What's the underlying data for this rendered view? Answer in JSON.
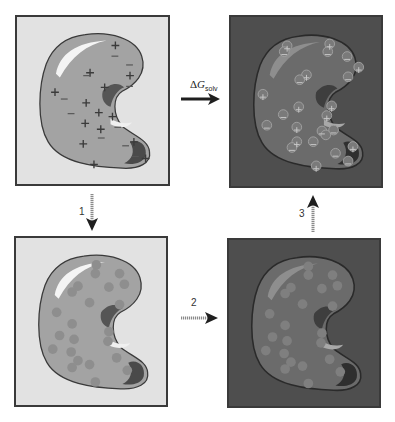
{
  "figure": {
    "colors": {
      "vacuum_bg": "#e2e2e2",
      "solvent_bg": "#4e4e4e",
      "protein_fill_vacuum": "#a3a3a3",
      "protein_fill_solvent": "#6b6b6b",
      "panel_border": "#3a3a3a",
      "arrow_solid": "#1f1f1f",
      "arrow_dashed": "#8a8a8a"
    },
    "panels": [
      {
        "id": "top-left",
        "environment": "vacuum",
        "charges": "on"
      },
      {
        "id": "top-right",
        "environment": "solvent",
        "charges": "on"
      },
      {
        "id": "bottom-left",
        "environment": "vacuum",
        "charges": "off"
      },
      {
        "id": "bottom-right",
        "environment": "solvent",
        "charges": "off"
      }
    ],
    "arrows": {
      "main": {
        "symbol": "Δ",
        "var": "G",
        "subscript": "solv",
        "direction": "right"
      },
      "step1": {
        "label": "1",
        "direction": "down"
      },
      "step2": {
        "label": "2",
        "direction": "right"
      },
      "step3": {
        "label": "3",
        "direction": "up"
      }
    }
  }
}
